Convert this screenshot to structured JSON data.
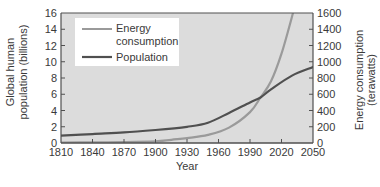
{
  "chart_data": {
    "type": "line",
    "title": "",
    "xlabel": "Year",
    "ylabel_left": "Global human population (billions)",
    "ylabel_right": "Energy consumption (terawatts)",
    "ylabel_left_lines": [
      "Global human",
      "population (billions)"
    ],
    "ylabel_right_lines": [
      "Energy consumption",
      "(terawatts)"
    ],
    "xlim": [
      1810,
      2050
    ],
    "ylim_left": [
      0,
      16
    ],
    "ylim_right": [
      0,
      1600
    ],
    "x_ticks": [
      1810,
      1840,
      1870,
      1900,
      1930,
      1960,
      1990,
      2020,
      2050
    ],
    "y_ticks_left": [
      0,
      2,
      4,
      6,
      8,
      10,
      12,
      14,
      16
    ],
    "y_ticks_right": [
      0,
      200,
      400,
      600,
      800,
      1000,
      1200,
      1400,
      1600
    ],
    "grid": false,
    "legend_position": "top-left",
    "series": [
      {
        "name": "Energy consumption",
        "legend_lines": [
          "Energy",
          "consumption"
        ],
        "axis": "right",
        "color": "#9a9a9a",
        "x": [
          1810,
          1840,
          1870,
          1900,
          1915,
          1930,
          1950,
          1970,
          1990,
          2000,
          2010,
          2020,
          2031
        ],
        "y": [
          5,
          8,
          12,
          20,
          40,
          60,
          100,
          190,
          380,
          560,
          760,
          1100,
          1600
        ]
      },
      {
        "name": "Population",
        "legend_lines": [
          "Population"
        ],
        "axis": "left",
        "color": "#505050",
        "x": [
          1810,
          1840,
          1870,
          1900,
          1930,
          1950,
          1970,
          1990,
          2000,
          2010,
          2030,
          2050
        ],
        "y": [
          0.9,
          1.1,
          1.3,
          1.6,
          2.0,
          2.5,
          3.7,
          5.0,
          5.6,
          6.6,
          8.3,
          9.35
        ]
      }
    ]
  },
  "colors": {
    "plot_background": "#dcdcdc",
    "axis": "#505050"
  }
}
